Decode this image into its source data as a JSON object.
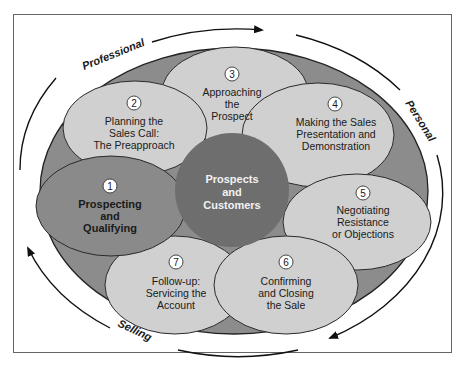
{
  "colors": {
    "frame": "#555555",
    "outer_ellipse": "#8c8c8c",
    "step_light": "#d0d0d0",
    "step_highlight": "#8a8a8a",
    "center": "#6e6e6e",
    "stroke": "#2a2a2a",
    "center_text": "#f2f2f2"
  },
  "cycle_labels": {
    "top": "Professional",
    "right": "Personal",
    "bottom": "Selling"
  },
  "center": {
    "line1": "Prospects",
    "line2": "and",
    "line3": "Customers"
  },
  "steps": [
    {
      "number": "1",
      "lines": [
        "Prospecting",
        "and",
        "Qualifying"
      ],
      "highlighted": true
    },
    {
      "number": "2",
      "lines": [
        "Planning the",
        "Sales Call:",
        "The Preapproach"
      ],
      "highlighted": false
    },
    {
      "number": "3",
      "lines": [
        "Approaching",
        "the",
        "Prospect"
      ],
      "highlighted": false
    },
    {
      "number": "4",
      "lines": [
        "Making the Sales",
        "Presentation and",
        "Demonstration"
      ],
      "highlighted": false
    },
    {
      "number": "5",
      "lines": [
        "Negotiating",
        "Resistance",
        "or Objections"
      ],
      "highlighted": false
    },
    {
      "number": "6",
      "lines": [
        "Confirming",
        "and Closing",
        "the Sale"
      ],
      "highlighted": false
    },
    {
      "number": "7",
      "lines": [
        "Follow-up:",
        "Servicing the",
        "Account"
      ],
      "highlighted": false
    }
  ]
}
